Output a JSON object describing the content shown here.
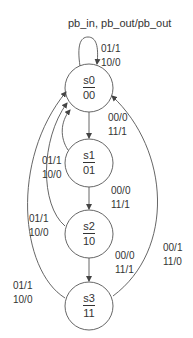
{
  "diagram": {
    "type": "state-machine",
    "header": "pb_in, pb_out/pb_out",
    "states": [
      {
        "id": "s0",
        "name": "s0",
        "code": "00"
      },
      {
        "id": "s1",
        "name": "s1",
        "code": "01"
      },
      {
        "id": "s2",
        "name": "s2",
        "code": "10"
      },
      {
        "id": "s3",
        "name": "s3",
        "code": "11"
      }
    ],
    "transitions": [
      {
        "from": "s0",
        "to": "s0",
        "line1": "01/1",
        "line2": "10/0"
      },
      {
        "from": "s0",
        "to": "s1",
        "line1": "00/0",
        "line2": "11/1"
      },
      {
        "from": "s1",
        "to": "s2",
        "line1": "00/0",
        "line2": "11/1"
      },
      {
        "from": "s2",
        "to": "s3",
        "line1": "00/0",
        "line2": "11/1"
      },
      {
        "from": "s1",
        "to": "s0",
        "line1": "01/1",
        "line2": "10/0"
      },
      {
        "from": "s2",
        "to": "s0",
        "line1": "01/1",
        "line2": "10/0"
      },
      {
        "from": "s3",
        "to": "s0",
        "line1": "01/1",
        "line2": "10/0"
      },
      {
        "from": "s3",
        "to": "s0",
        "line1": "00/1",
        "line2": "11/0"
      }
    ],
    "colors": {
      "stroke": "#444444",
      "text": "#333333",
      "background": "#ffffff"
    }
  }
}
